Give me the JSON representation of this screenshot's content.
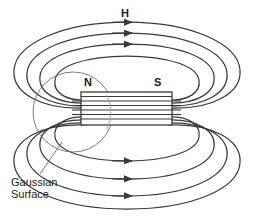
{
  "diagram": {
    "background_color": "#ffffff",
    "line_color": "#3a3a3a",
    "thin_line_color": "#6e6e6e",
    "text_color": "#1a1a1a",
    "width": 255,
    "height": 216
  },
  "labels": {
    "field_label": "H",
    "north_pole": "N",
    "south_pole": "S",
    "gaussian_surface": "Gaussian\nSurface"
  },
  "magnet": {
    "x": 81,
    "y": 92,
    "width": 91,
    "height": 33,
    "internal_line_count": 7,
    "stroke": "#3a3a3a"
  },
  "gaussian_surface": {
    "shape": "circle",
    "center_x": 73,
    "center_y": 112,
    "radius": 40,
    "stroke": "#6e6e6e",
    "leader_from_x": 40,
    "leader_from_y": 174,
    "leader_to_x": 62,
    "leader_to_y": 142
  },
  "field_lines": {
    "loop_count_top": 4,
    "loop_count_bottom": 4,
    "arrow_count_top": 3,
    "arrow_count_bottom": 3,
    "direction": "left-to-right",
    "arrow_x": 127
  }
}
